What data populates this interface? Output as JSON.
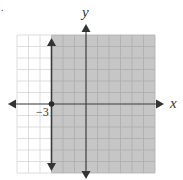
{
  "figure": {
    "marker_text": "."
  },
  "chart_data": {
    "type": "inequality-graph",
    "title": "",
    "inequality": "x ≥ -3",
    "boundary": {
      "type": "vertical-line",
      "x": -3,
      "style": "solid",
      "arrows": "both-ends",
      "point_marked": [
        -3,
        0
      ]
    },
    "shaded_region": "x >= -3",
    "xlabel": "x",
    "ylabel": "y",
    "xlim": [
      -6,
      6
    ],
    "ylim": [
      -6,
      6
    ],
    "grid": true,
    "grid_step": 1,
    "tick_labels": [
      {
        "axis": "x",
        "value": -3,
        "label": "−3"
      }
    ],
    "colors": {
      "shade": "#c6c6c6",
      "grid_unshaded": "#d6d6d6",
      "grid_shaded": "#adadad",
      "axis": "#444444",
      "boundary": "#3a3a3a"
    }
  }
}
